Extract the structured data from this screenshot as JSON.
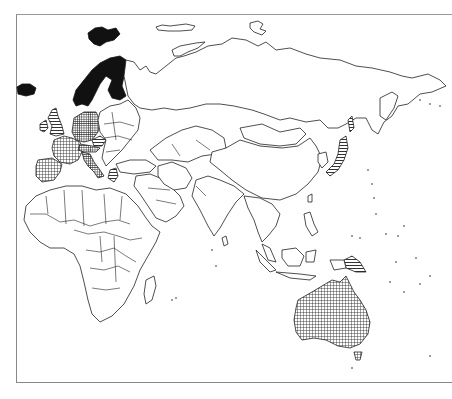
{
  "title": {
    "text_visible": "",
    "note": ""
  },
  "map": {
    "projection_region": "Europe, Africa, Asia, Oceania",
    "frame_color": "#888888",
    "line_color": "#222222",
    "background": "#ffffff",
    "legend_categories": [
      {
        "id": "solid",
        "pattern": "solid-black",
        "color": "#111111",
        "regions": [
          "Norway",
          "Sweden",
          "Finland",
          "Svalbard",
          "Iceland"
        ]
      },
      {
        "id": "dense",
        "pattern": "dense-crosshatch",
        "color": "#444444",
        "regions": [
          "Germany",
          "Poland",
          "Italy",
          "Austria",
          "Switzerland"
        ]
      },
      {
        "id": "grid",
        "pattern": "crosshatch",
        "color": "#666666",
        "regions": [
          "France",
          "Spain",
          "Portugal",
          "Belgium",
          "Netherlands",
          "Australia"
        ]
      },
      {
        "id": "stripe",
        "pattern": "horizontal-stripes",
        "color": "#555555",
        "regions": [
          "United Kingdom",
          "Ireland",
          "Czechia",
          "Greece",
          "Japan",
          "Papua New Guinea"
        ]
      }
    ],
    "unshaded_regions": [
      "Russia",
      "China",
      "India",
      "Africa",
      "Middle East",
      "Southeast Asia",
      "Central Asia",
      "Mongolia"
    ]
  }
}
